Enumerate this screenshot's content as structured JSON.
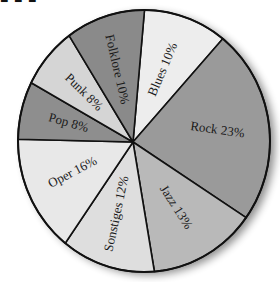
{
  "chart_data": {
    "type": "pie",
    "title": "",
    "labels": [
      "Blues",
      "Rock",
      "Jazz",
      "Sonstiges",
      "Oper",
      "Pop",
      "Punk",
      "Folklore"
    ],
    "values": [
      10,
      23,
      13,
      12,
      16,
      8,
      8,
      10
    ],
    "unit": "%",
    "slice_labels": [
      "Blues 10%",
      "Rock 23%",
      "Jazz 13%",
      "Sonstiges 12%",
      "Oper 16%",
      "Pop 8%",
      "Punk 8%",
      "Folklore 10%"
    ],
    "colors": [
      "#ededed",
      "#9a9a9a",
      "#b9b9b9",
      "#dedede",
      "#e8e8e8",
      "#8e8e8e",
      "#d5d5d5",
      "#8a8a8a"
    ],
    "legend": "none",
    "labels_inside_slices": true,
    "style": "hand-drawn grayscale, black outlines, drop shadow on right edge"
  },
  "title_fragment": "■ ■ ■"
}
